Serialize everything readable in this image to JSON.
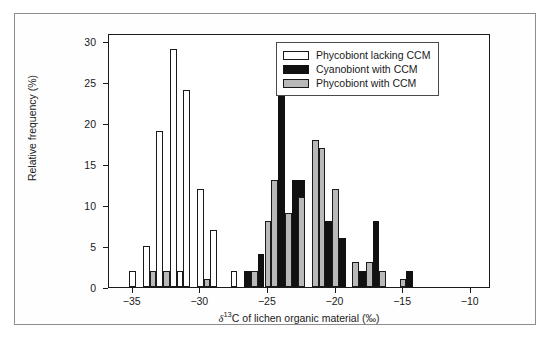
{
  "figure": {
    "background": "#ffffff",
    "frame_color": "#8d8d8d"
  },
  "colors": {
    "phycobiont_lacking_ccm": "#ffffff",
    "cyanobiont_with_ccm": "#111111",
    "phycobiont_with_ccm": "#b9b9b9",
    "axis": "#1a1a1a"
  },
  "legend": {
    "position": "top-right",
    "entries": [
      {
        "label": "Phycobiont lacking CCM",
        "style": "white"
      },
      {
        "label": "Cyanobiont with CCM",
        "style": "black"
      },
      {
        "label": "Phycobiont with CCM",
        "style": "gray"
      }
    ]
  },
  "axes": {
    "x": {
      "title_prefix": "",
      "title_symbol": "δ",
      "title_super": "13",
      "title_suffix": "C of lichen organic material (‰)",
      "ticks": [
        -35,
        -30,
        -25,
        -20,
        -15,
        -10
      ],
      "tick_labels": [
        "−35",
        "−30",
        "−25",
        "−20",
        "−15",
        "−10"
      ],
      "min": -36.75,
      "max": -8.5
    },
    "y": {
      "title": "Relative frequency (%)",
      "ticks": [
        0,
        5,
        10,
        15,
        20,
        25,
        30
      ],
      "tick_labels": [
        "0",
        "5",
        "10",
        "15",
        "20",
        "25",
        "30"
      ],
      "min": 0,
      "max": 31
    }
  },
  "chart_data": {
    "type": "bar",
    "title": "",
    "xlabel": "δ13C of lichen organic material (‰)",
    "ylabel": "Relative frequency (%)",
    "xlim": [
      -36.75,
      -8.5
    ],
    "ylim": [
      0,
      31
    ],
    "grid": false,
    "legend_position": "top-right",
    "bin_width": 0.5,
    "series": [
      {
        "name": "Phycobiont lacking CCM",
        "style": "white",
        "color": "#ffffff",
        "points": [
          {
            "x": -35.0,
            "y": 2
          },
          {
            "x": -34.0,
            "y": 5
          },
          {
            "x": -33.5,
            "y": 2
          },
          {
            "x": -33.0,
            "y": 19
          },
          {
            "x": -32.5,
            "y": 2
          },
          {
            "x": -32.0,
            "y": 29
          },
          {
            "x": -31.5,
            "y": 2
          },
          {
            "x": -31.0,
            "y": 24
          },
          {
            "x": -30.0,
            "y": 12
          },
          {
            "x": -29.5,
            "y": 1
          },
          {
            "x": -29.0,
            "y": 7
          },
          {
            "x": -27.5,
            "y": 2
          },
          {
            "x": -26.5,
            "y": 2
          }
        ]
      },
      {
        "name": "Cyanobiont with CCM",
        "style": "black",
        "color": "#111111",
        "points": [
          {
            "x": -26.5,
            "y": 2
          },
          {
            "x": -25.5,
            "y": 4
          },
          {
            "x": -24.5,
            "y": 8
          },
          {
            "x": -24.0,
            "y": 25
          },
          {
            "x": -23.0,
            "y": 13
          },
          {
            "x": -22.5,
            "y": 13
          },
          {
            "x": -21.5,
            "y": 8
          },
          {
            "x": -20.5,
            "y": 8
          },
          {
            "x": -19.5,
            "y": 6
          },
          {
            "x": -18.5,
            "y": 3
          },
          {
            "x": -18.0,
            "y": 2
          },
          {
            "x": -17.0,
            "y": 8
          },
          {
            "x": -16.5,
            "y": 2
          },
          {
            "x": -14.5,
            "y": 2
          }
        ]
      },
      {
        "name": "Phycobiont with CCM",
        "style": "gray",
        "color": "#b9b9b9",
        "points": [
          {
            "x": -33.5,
            "y": 2
          },
          {
            "x": -32.5,
            "y": 2
          },
          {
            "x": -29.5,
            "y": 1
          },
          {
            "x": -26.0,
            "y": 2
          },
          {
            "x": -25.0,
            "y": 8
          },
          {
            "x": -24.5,
            "y": 13
          },
          {
            "x": -23.5,
            "y": 9
          },
          {
            "x": -22.5,
            "y": 11
          },
          {
            "x": -21.5,
            "y": 18
          },
          {
            "x": -21.0,
            "y": 17
          },
          {
            "x": -20.0,
            "y": 12
          },
          {
            "x": -18.5,
            "y": 3
          },
          {
            "x": -17.5,
            "y": 3
          },
          {
            "x": -16.5,
            "y": 2
          },
          {
            "x": -15.0,
            "y": 1
          }
        ]
      }
    ]
  }
}
